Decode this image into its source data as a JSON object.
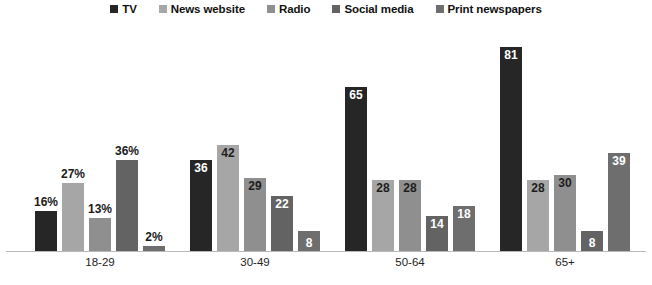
{
  "legend": {
    "position": "top-center",
    "items": [
      {
        "label": "TV",
        "color": "#262626"
      },
      {
        "label": "News website",
        "color": "#a6a6a6"
      },
      {
        "label": "Radio",
        "color": "#8f8f8f"
      },
      {
        "label": "Social media",
        "color": "#636363"
      },
      {
        "label": "Print newspapers",
        "color": "#6e6e6e"
      }
    ]
  },
  "chart_data": {
    "type": "bar",
    "title": "",
    "subtitle": "",
    "xlabel": "",
    "ylabel": "",
    "ylim": [
      0,
      90
    ],
    "grid": false,
    "legend_position": "top-center",
    "categories": [
      "18-29",
      "30-49",
      "50-64",
      "65+"
    ],
    "series": [
      {
        "name": "TV",
        "color": "#262626",
        "values": [
          16,
          36,
          65,
          81
        ],
        "labels": [
          "16%",
          "36",
          "65",
          "81"
        ]
      },
      {
        "name": "News website",
        "color": "#a6a6a6",
        "values": [
          27,
          42,
          28,
          28
        ],
        "labels": [
          "27%",
          "42",
          "28",
          "28"
        ]
      },
      {
        "name": "Radio",
        "color": "#8f8f8f",
        "values": [
          13,
          29,
          28,
          30
        ],
        "labels": [
          "13%",
          "29",
          "28",
          "30"
        ]
      },
      {
        "name": "Social media",
        "color": "#636363",
        "values": [
          36,
          22,
          14,
          8
        ],
        "labels": [
          "36%",
          "22",
          "14",
          "8"
        ]
      },
      {
        "name": "Print newspapers",
        "color": "#6e6e6e",
        "values": [
          2,
          8,
          18,
          39
        ],
        "labels": [
          "2%",
          "8",
          "18",
          "39"
        ]
      }
    ]
  }
}
